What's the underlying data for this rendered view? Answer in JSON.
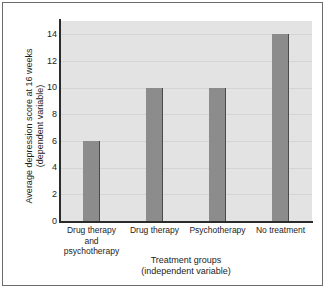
{
  "chart_data": {
    "type": "bar",
    "title": "",
    "subtitle": "",
    "categories": [
      "Drug therapy and psychotherapy",
      "Drug therapy",
      "Psychotherapy",
      "No treatment"
    ],
    "category_lines": [
      [
        "Drug therapy and",
        "psychotherapy"
      ],
      [
        "Drug therapy"
      ],
      [
        "Psychotherapy"
      ],
      [
        "No treatment"
      ]
    ],
    "values": [
      6,
      10,
      10,
      14
    ],
    "xlabel": "Treatment groups",
    "xlabel_line2": "(independent variable)",
    "ylabel": "Average depression score at 16 weeks",
    "ylabel_line2": "(dependent variable)",
    "ylim": [
      0,
      15
    ],
    "yticks": [
      14,
      12,
      10,
      8,
      6,
      4,
      2,
      0
    ],
    "ytick_labels": [
      "14",
      "12",
      "10",
      "8",
      "6",
      "4",
      "2",
      "0"
    ],
    "grid": true,
    "grid_axis": "y",
    "legend": false,
    "legend_position": "none",
    "colors": {
      "bar_fill": "#8c8c8c",
      "bar_edge": "#4a4a4a",
      "plot_background": "#e3e3e3",
      "gridline": "#d4d4d4",
      "axis_line": "#2b2b2b",
      "text": "#1d1d1d",
      "figure_border": "#6a6a6a",
      "page_background": "#ffffff"
    }
  }
}
